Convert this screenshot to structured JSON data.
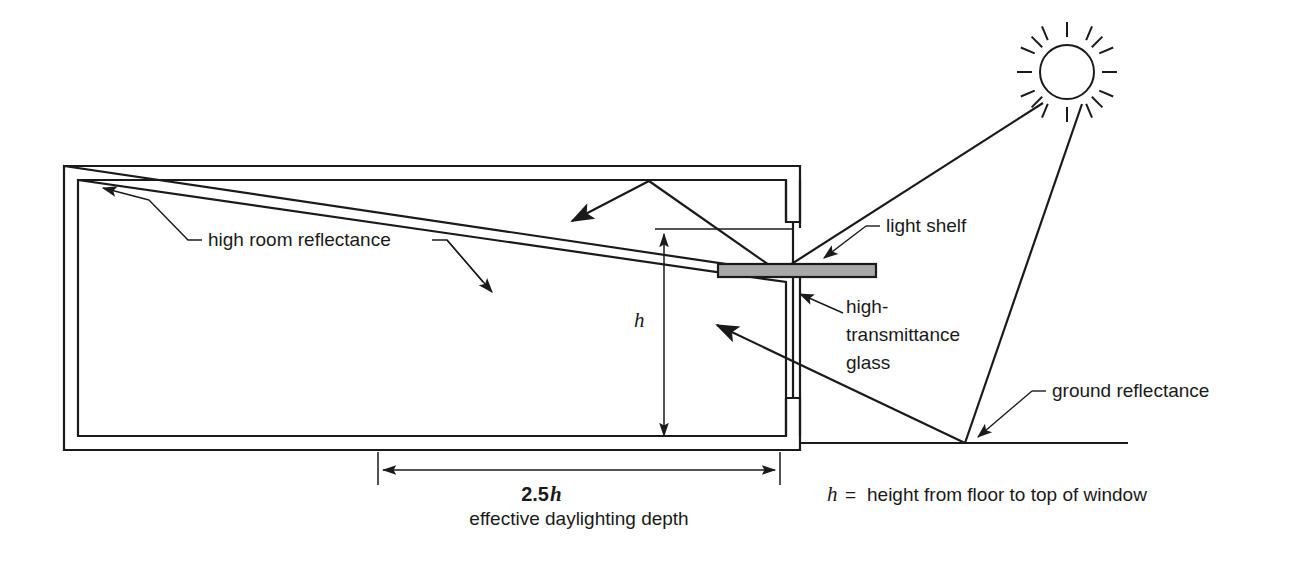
{
  "diagram": {
    "labels": {
      "high_room_reflectance": "high room reflectance",
      "light_shelf": "light shelf",
      "high_transmittance_glass_line1": "high-",
      "high_transmittance_glass_line2": "transmittance",
      "high_transmittance_glass_line3": "glass",
      "ground_reflectance": "ground reflectance"
    },
    "dimensions": {
      "height_symbol": "h",
      "depth_value": "2.5",
      "depth_symbol": "h",
      "depth_caption": "effective daylighting depth"
    },
    "legend": {
      "symbol": "h",
      "equals": "=",
      "definition": "height from floor to top of window"
    },
    "icons": {
      "sun": "sun-icon",
      "light_shelf": "light-shelf-icon"
    },
    "colors": {
      "line": "#1a1a1a",
      "shelf_fill": "#a8a8a8",
      "background": "#ffffff"
    }
  }
}
